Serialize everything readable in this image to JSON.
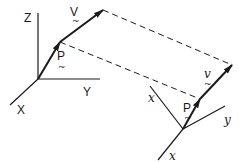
{
  "diagram": {
    "colors": {
      "ink": "#1a1a1a",
      "background": "#ffffff"
    },
    "left_frame": {
      "axes": {
        "z": "Z",
        "y": "Y",
        "x": "X"
      },
      "vectors": {
        "position": "P",
        "velocity": "V"
      }
    },
    "right_frame": {
      "axes": {
        "x_upper": "x",
        "y": "y",
        "x_lower": "x"
      },
      "vectors": {
        "position": "P",
        "velocity": "v"
      }
    },
    "tilde": "~",
    "connectors": [
      "dashed-line-velocity-tip",
      "dashed-line-position-tip"
    ]
  }
}
